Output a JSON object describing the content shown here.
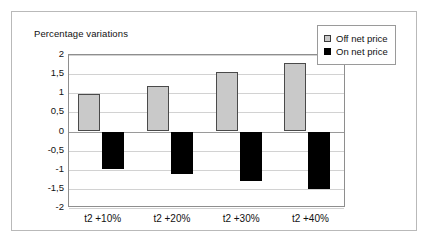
{
  "chart_data": {
    "type": "bar",
    "title": "Percentage variations",
    "xlabel": "",
    "ylabel": "",
    "categories": [
      "t2 +10%",
      "t2 +20%",
      "t2 +30%",
      "t2 +40%"
    ],
    "series": [
      {
        "name": "Off net price",
        "color": "#c9c9c9",
        "values": [
          0.97,
          1.2,
          1.55,
          1.8
        ]
      },
      {
        "name": "On net price",
        "color": "#000000",
        "values": [
          -0.97,
          -1.1,
          -1.3,
          -1.5
        ]
      }
    ],
    "ylim": [
      -2,
      2
    ],
    "ytick_step": 0.5,
    "ytick_labels": [
      "2",
      "1,5",
      "1",
      "0,5",
      "0",
      "-0,5",
      "-1",
      "-1,5",
      "-2"
    ],
    "ytick_values": [
      2,
      1.5,
      1,
      0.5,
      0,
      -0.5,
      -1,
      -1.5,
      -2
    ],
    "grid": true,
    "legend_position": "top-right",
    "decimal_separator": ","
  },
  "legend": {
    "items": [
      {
        "label": "Off net price",
        "swatch": "off"
      },
      {
        "label": "On net price",
        "swatch": "on"
      }
    ]
  }
}
